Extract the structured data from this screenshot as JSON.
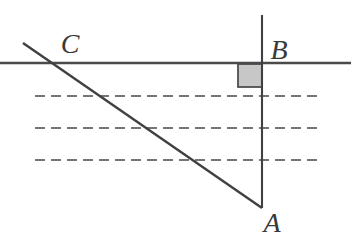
{
  "figure": {
    "type": "geometry-diagram",
    "labels": {
      "A": "A",
      "B": "B",
      "C": "C"
    },
    "colors": {
      "background": "#ffffff",
      "solid_line": "#434343",
      "dashed_line": "#767676",
      "right_angle_fill": "#c7c7c7",
      "right_angle_border": "#4f4f4f",
      "label_text": "#3a3a3a"
    },
    "geometry": {
      "surface_line": {
        "x1": 0,
        "y1": 63,
        "x2": 351,
        "y2": 63,
        "stroke": "#4a4a4a",
        "stroke-width": 2.4
      },
      "vertical_line_AB": {
        "x1": 262,
        "y1": 15,
        "x2": 262,
        "y2": 208,
        "stroke": "#404040",
        "stroke-width": 2.1
      },
      "hypotenuse_CA": {
        "x1": 23,
        "y1": 43,
        "x2": 262,
        "y2": 208,
        "stroke": "#404040",
        "stroke-width": 2.4
      },
      "right_angle_marker": {
        "x": 238,
        "y": 64,
        "width": 24,
        "height": 23,
        "fill": "#c7c7c7",
        "stroke": "#4f4f4f",
        "stroke-width": 1.8
      },
      "dashed_lines": [
        {
          "x1": 35,
          "y1": 96,
          "x2": 317,
          "y2": 96,
          "stroke": "#767676",
          "stroke-width": 1.9,
          "stroke-dasharray": "10 6"
        },
        {
          "x1": 35,
          "y1": 128,
          "x2": 317,
          "y2": 128,
          "stroke": "#767676",
          "stroke-width": 1.9,
          "stroke-dasharray": "10 6"
        },
        {
          "x1": 35,
          "y1": 160,
          "x2": 317,
          "y2": 160,
          "stroke": "#767676",
          "stroke-width": 1.9,
          "stroke-dasharray": "10 6"
        }
      ]
    },
    "label_positions": {
      "A": {
        "x": 272,
        "y": 224
      },
      "B": {
        "x": 279,
        "y": 51
      },
      "C": {
        "x": 70,
        "y": 45
      }
    }
  }
}
